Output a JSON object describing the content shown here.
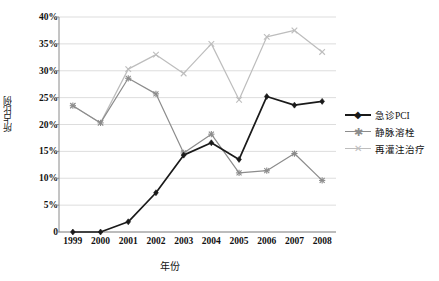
{
  "chart_data": {
    "type": "line",
    "title": "",
    "xlabel": "年份",
    "ylabel": "所占比例",
    "x": [
      1999,
      2000,
      2001,
      2002,
      2003,
      2004,
      2005,
      2006,
      2007,
      2008
    ],
    "categories": [
      "1999",
      "2000",
      "2001",
      "2002",
      "2003",
      "2004",
      "2005",
      "2006",
      "2007",
      "2008"
    ],
    "ylim": [
      0,
      40
    ],
    "ytick_labels": [
      "0",
      "5%",
      "10%",
      "15%",
      "20%",
      "25%",
      "30%",
      "35%",
      "40%"
    ],
    "ytick_values": [
      0,
      5,
      10,
      15,
      20,
      25,
      30,
      35,
      40
    ],
    "grid": "horizontal",
    "legend_position": "right",
    "series": [
      {
        "name": "急诊PCI",
        "marker": "diamond",
        "color": "#1a1a1a",
        "values": [
          0,
          0,
          1.9,
          7.3,
          14.3,
          16.6,
          13.5,
          25.2,
          23.6,
          24.3
        ]
      },
      {
        "name": "静脉溶栓",
        "marker": "asterisk",
        "color": "#8c8c8c",
        "values": [
          23.5,
          20.3,
          28.6,
          25.7,
          14.7,
          18.2,
          11.0,
          11.4,
          14.6,
          9.6
        ]
      },
      {
        "name": "再灌注治疗",
        "marker": "x",
        "color": "#bdbdbd",
        "values": [
          23.5,
          20.3,
          30.3,
          33.0,
          29.5,
          35.0,
          24.6,
          36.3,
          37.5,
          33.5
        ]
      }
    ]
  },
  "legend": {
    "items": [
      {
        "label": "急诊PCI"
      },
      {
        "label": "静脉溶栓"
      },
      {
        "label": "再灌注治疗"
      }
    ]
  },
  "colors": {
    "pci": "#1a1a1a",
    "thrombolysis": "#8c8c8c",
    "reperfusion": "#bdbdbd",
    "grid": "#d9d9d9",
    "axis": "#8a8a8a"
  }
}
